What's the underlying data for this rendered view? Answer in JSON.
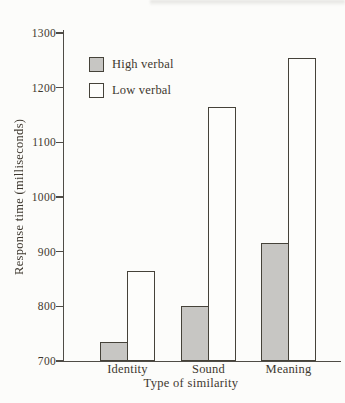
{
  "chart_data": {
    "type": "bar",
    "title": "",
    "xlabel": "Type of similarity",
    "ylabel": "Response time (milliseconds)",
    "categories": [
      "Identity",
      "Sound",
      "Meaning"
    ],
    "series": [
      {
        "name": "High verbal",
        "values": [
          735,
          800,
          915
        ],
        "fill": "#c7c6c3",
        "swatch": "gray-textured"
      },
      {
        "name": "Low verbal",
        "values": [
          865,
          1165,
          1255
        ],
        "fill": "#fdfdfb",
        "swatch": "white"
      }
    ],
    "ylim": [
      700,
      1300
    ],
    "yticks": [
      700,
      800,
      900,
      1000,
      1100,
      1200,
      1300
    ],
    "grid": false,
    "legend_position": "top-left"
  },
  "colors": {
    "axis": "#4f4c46",
    "text": "#3e382f",
    "bar_outline": "#454239",
    "high_verbal_fill": "#c7c6c3",
    "low_verbal_fill": "#fdfdfb",
    "background": "#fcfcfa"
  }
}
